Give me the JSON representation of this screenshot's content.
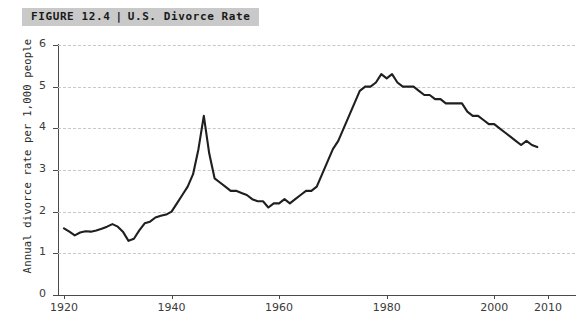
{
  "banner": {
    "figure_number": "FIGURE 12.4",
    "separator": "|",
    "title": "U.S. Divorce Rate",
    "background_color": "#c9c9c9"
  },
  "axes": {
    "ylabel": "Annual divorce rate per 1,000 people",
    "xlabel": "",
    "y_ticks": [
      "0",
      "1",
      "2",
      "3",
      "4",
      "5",
      "6"
    ],
    "x_ticks": [
      "1920",
      "1940",
      "1960",
      "1980",
      "2000",
      "2010"
    ]
  },
  "style": {
    "line_color": "#1f1f1f",
    "grid_color": "#c3c9cf",
    "axis_color": "#4a4a4a",
    "background": "#ffffff"
  },
  "chart_data": {
    "type": "line",
    "title": "U.S. Divorce Rate",
    "xlabel": "",
    "ylabel": "Annual divorce rate per 1,000 people",
    "xlim": [
      1920,
      2010
    ],
    "ylim": [
      0,
      6
    ],
    "grid": true,
    "legend": false,
    "x_tick_values": [
      1920,
      1940,
      1960,
      1980,
      2000,
      2010
    ],
    "y_tick_values": [
      0,
      1,
      2,
      3,
      4,
      5,
      6
    ],
    "series": [
      {
        "name": "Annual divorce rate per 1,000 people",
        "x": [
          1920,
          1921,
          1922,
          1923,
          1924,
          1925,
          1926,
          1927,
          1928,
          1929,
          1930,
          1931,
          1932,
          1933,
          1934,
          1935,
          1936,
          1937,
          1938,
          1939,
          1940,
          1941,
          1942,
          1943,
          1944,
          1945,
          1946,
          1947,
          1948,
          1949,
          1950,
          1951,
          1952,
          1953,
          1954,
          1955,
          1956,
          1957,
          1958,
          1959,
          1960,
          1961,
          1962,
          1963,
          1964,
          1965,
          1966,
          1967,
          1968,
          1969,
          1970,
          1971,
          1972,
          1973,
          1974,
          1975,
          1976,
          1977,
          1978,
          1979,
          1980,
          1981,
          1982,
          1983,
          1984,
          1985,
          1986,
          1987,
          1988,
          1989,
          1990,
          1991,
          1992,
          1993,
          1994,
          1995,
          1996,
          1997,
          1998,
          1999,
          2000,
          2001,
          2002,
          2003,
          2004,
          2005,
          2006,
          2007,
          2008
        ],
        "values": [
          1.6,
          1.52,
          1.43,
          1.5,
          1.53,
          1.52,
          1.55,
          1.59,
          1.64,
          1.7,
          1.64,
          1.51,
          1.3,
          1.35,
          1.55,
          1.72,
          1.76,
          1.86,
          1.9,
          1.93,
          2.0,
          2.2,
          2.4,
          2.6,
          2.9,
          3.5,
          4.3,
          3.4,
          2.8,
          2.7,
          2.6,
          2.5,
          2.5,
          2.45,
          2.4,
          2.3,
          2.25,
          2.25,
          2.1,
          2.2,
          2.2,
          2.3,
          2.2,
          2.3,
          2.4,
          2.5,
          2.5,
          2.6,
          2.9,
          3.2,
          3.5,
          3.7,
          4.0,
          4.3,
          4.6,
          4.9,
          5.0,
          5.0,
          5.1,
          5.3,
          5.2,
          5.3,
          5.1,
          5.0,
          5.0,
          5.0,
          4.9,
          4.8,
          4.8,
          4.7,
          4.7,
          4.6,
          4.6,
          4.6,
          4.6,
          4.4,
          4.3,
          4.3,
          4.2,
          4.1,
          4.1,
          4.0,
          3.9,
          3.8,
          3.7,
          3.6,
          3.7,
          3.6,
          3.55
        ]
      }
    ]
  }
}
